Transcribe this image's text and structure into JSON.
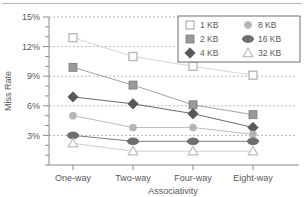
{
  "chart_data": {
    "type": "line",
    "title": "",
    "xlabel": "Associativity",
    "ylabel": "Miss Rate",
    "categories": [
      "One-way",
      "Two-way",
      "Four-way",
      "Eight-way"
    ],
    "ylim": [
      0,
      15
    ],
    "ytick_labels": [
      "15%",
      "12%",
      "9%",
      "6%",
      "3%"
    ],
    "ytick_values": [
      15,
      12,
      9,
      6,
      3
    ],
    "minor_tick_step": 1,
    "grid": "horizontal-dashed",
    "legend_position": "top-right",
    "series": [
      {
        "name": "1 KB",
        "marker": "open-square",
        "color": "#d9d9d9",
        "line_color": "#cfcfcf",
        "values": [
          12.9,
          11.0,
          10.0,
          9.1
        ]
      },
      {
        "name": "2 KB",
        "marker": "filled-square",
        "color": "#9a9a9a",
        "line_color": "#9a9a9a",
        "values": [
          9.9,
          8.1,
          6.1,
          5.1
        ]
      },
      {
        "name": "4 KB",
        "marker": "diamond",
        "color": "#58585a",
        "line_color": "#58585a",
        "values": [
          6.9,
          6.2,
          5.2,
          3.8
        ]
      },
      {
        "name": "8 KB",
        "marker": "circle",
        "color": "#b5b5b5",
        "line_color": "#b5b5b5",
        "values": [
          5.0,
          3.8,
          3.8,
          3.1
        ]
      },
      {
        "name": "16 KB",
        "marker": "ellipse",
        "color": "#6e6e70",
        "line_color": "#6e6e70",
        "values": [
          3.0,
          2.4,
          2.4,
          2.4
        ]
      },
      {
        "name": "32 KB",
        "marker": "open-triangle",
        "color": "#bdbdbd",
        "line_color": "#c6c6c6",
        "values": [
          2.2,
          1.4,
          1.4,
          1.4
        ]
      }
    ]
  },
  "legend": {
    "entries": [
      {
        "label": "1 KB",
        "icon": "open-square-marker-icon"
      },
      {
        "label": "2 KB",
        "icon": "filled-square-marker-icon"
      },
      {
        "label": "4 KB",
        "icon": "diamond-marker-icon"
      },
      {
        "label": "8 KB",
        "icon": "circle-marker-icon"
      },
      {
        "label": "16 KB",
        "icon": "ellipse-marker-icon"
      },
      {
        "label": "32 KB",
        "icon": "open-triangle-marker-icon"
      }
    ]
  }
}
